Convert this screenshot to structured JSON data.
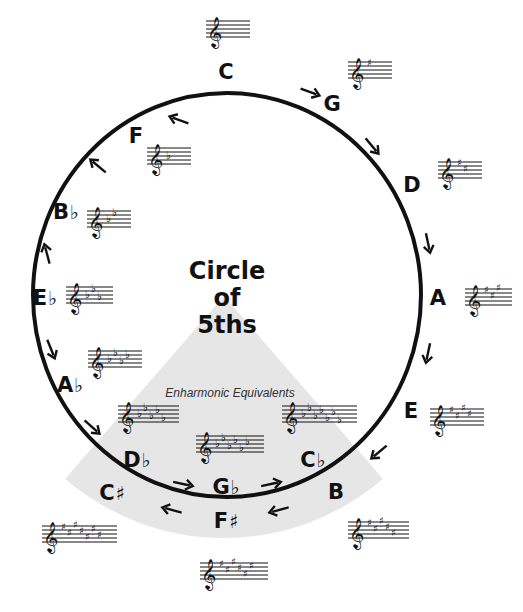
{
  "title": {
    "line1": "Circle",
    "line2": "of",
    "line3": "5ths"
  },
  "enharmonic_label": "Enharmonic Equivalents",
  "colors": {
    "ink": "#111111",
    "wedge": "#e6e6e6",
    "background": "#ffffff"
  },
  "circle": {
    "cx": 227,
    "cy": 295,
    "rx": 194,
    "ry": 202,
    "stroke_width": 4
  },
  "wedge": {
    "apex_x": 224,
    "apex_y": 296,
    "radius": 242,
    "half_angle_deg": 41
  },
  "keys": [
    {
      "id": "c",
      "letter": "C",
      "acc": "",
      "lx": 226,
      "ly": 72,
      "staff": {
        "x": 206,
        "y": 15,
        "type": "none",
        "count": 0
      }
    },
    {
      "id": "g",
      "letter": "G",
      "acc": "",
      "lx": 332,
      "ly": 104,
      "staff": {
        "x": 348,
        "y": 56,
        "type": "sharp",
        "count": 1
      }
    },
    {
      "id": "d",
      "letter": "D",
      "acc": "",
      "lx": 412,
      "ly": 185,
      "staff": {
        "x": 438,
        "y": 156,
        "type": "sharp",
        "count": 2
      }
    },
    {
      "id": "a",
      "letter": "A",
      "acc": "",
      "lx": 438,
      "ly": 298,
      "staff": {
        "x": 465,
        "y": 283,
        "type": "sharp",
        "count": 3
      }
    },
    {
      "id": "e",
      "letter": "E",
      "acc": "",
      "lx": 411,
      "ly": 411,
      "staff": {
        "x": 430,
        "y": 403,
        "type": "sharp",
        "count": 4
      }
    },
    {
      "id": "b",
      "letter": "B",
      "acc": "",
      "lx": 336,
      "ly": 492,
      "staff": {
        "x": 348,
        "y": 516,
        "type": "sharp",
        "count": 5
      }
    },
    {
      "id": "fs",
      "letter": "F",
      "acc": "♯",
      "lx": 226,
      "ly": 521,
      "staff": {
        "x": 200,
        "y": 557,
        "type": "sharp",
        "count": 6
      }
    },
    {
      "id": "cs",
      "letter": "C",
      "acc": "♯",
      "lx": 112,
      "ly": 493,
      "staff": {
        "x": 42,
        "y": 520,
        "type": "sharp",
        "count": 7
      }
    },
    {
      "id": "f",
      "letter": "F",
      "acc": "",
      "lx": 136,
      "ly": 136,
      "staff": {
        "x": 147,
        "y": 142,
        "type": "flat",
        "count": 1
      }
    },
    {
      "id": "bb",
      "letter": "B",
      "acc": "♭",
      "lx": 66,
      "ly": 212,
      "staff": {
        "x": 87,
        "y": 205,
        "type": "flat",
        "count": 2
      }
    },
    {
      "id": "eb",
      "letter": "E",
      "acc": "♭",
      "lx": 45,
      "ly": 298,
      "staff": {
        "x": 66,
        "y": 281,
        "type": "flat",
        "count": 3
      }
    },
    {
      "id": "ab",
      "letter": "A",
      "acc": "♭",
      "lx": 70,
      "ly": 385,
      "staff": {
        "x": 88,
        "y": 345,
        "type": "flat",
        "count": 4
      }
    },
    {
      "id": "db",
      "letter": "D",
      "acc": "♭",
      "lx": 137,
      "ly": 460,
      "staff": {
        "x": 118,
        "y": 400,
        "type": "flat",
        "count": 5
      }
    },
    {
      "id": "gb",
      "letter": "G",
      "acc": "♭",
      "lx": 226,
      "ly": 487,
      "staff": {
        "x": 196,
        "y": 430,
        "type": "flat",
        "count": 6
      }
    },
    {
      "id": "cb",
      "letter": "C",
      "acc": "♭",
      "lx": 313,
      "ly": 460,
      "staff": {
        "x": 282,
        "y": 400,
        "type": "flat",
        "count": 7
      }
    }
  ],
  "arrows": [
    {
      "name": "arrow-c-to-g",
      "x": 310,
      "y": 92,
      "angle": 20
    },
    {
      "name": "arrow-g-to-d",
      "x": 372,
      "y": 146,
      "angle": 50
    },
    {
      "name": "arrow-d-to-a",
      "x": 428,
      "y": 243,
      "angle": 78
    },
    {
      "name": "arrow-a-to-e",
      "x": 428,
      "y": 353,
      "angle": 102
    },
    {
      "name": "arrow-e-to-b",
      "x": 379,
      "y": 452,
      "angle": 140
    },
    {
      "name": "arrow-b-to-fs",
      "x": 279,
      "y": 510,
      "angle": 165
    },
    {
      "name": "arrow-fs-to-cs",
      "x": 172,
      "y": 510,
      "angle": 195
    },
    {
      "name": "arrow-cs-gb",
      "x": 183,
      "y": 484,
      "angle": 12
    },
    {
      "name": "arrow-gb-cb",
      "x": 271,
      "y": 484,
      "angle": -12
    },
    {
      "name": "arrow-c-to-f",
      "x": 179,
      "y": 120,
      "angle": 200
    },
    {
      "name": "arrow-f-to-bb",
      "x": 98,
      "y": 166,
      "angle": 220
    },
    {
      "name": "arrow-bb-to-eb",
      "x": 47,
      "y": 254,
      "angle": 255
    },
    {
      "name": "arrow-eb-to-ab",
      "x": 51,
      "y": 349,
      "angle": 68
    },
    {
      "name": "arrow-ab-to-db",
      "x": 92,
      "y": 427,
      "angle": 42
    }
  ]
}
